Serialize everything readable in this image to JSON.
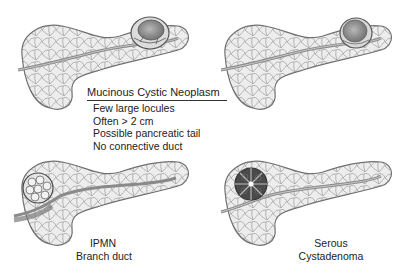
{
  "figure": {
    "panels": [
      {
        "id": "mcn",
        "lesion": "Mucinous Cystic Neoplasm",
        "location": "tail",
        "cyst_style": "unilocular-large"
      },
      {
        "id": "tail-cyst",
        "lesion": "",
        "location": "tail",
        "cyst_style": "unilocular-large"
      },
      {
        "id": "ipmn",
        "lesion": "IPMN Branch duct",
        "location": "head",
        "cyst_style": "grape-cluster"
      },
      {
        "id": "serous",
        "lesion": "Serous Cystadenoma",
        "location": "head",
        "cyst_style": "microcystic-central-scar"
      }
    ],
    "mcn_callout": {
      "title": "Mucinous Cystic Neoplasm",
      "features": [
        "Few large locules",
        "Often > 2 cm",
        "Possible pancreatic tail",
        "No connective duct"
      ]
    },
    "ipmn_label": {
      "line1": "IPMN",
      "line2": "Branch duct"
    },
    "serous_label": {
      "line1": "Serous",
      "line2": "Cystadenoma"
    },
    "colors": {
      "parenchyma_fill": "#ececec",
      "lobule_stroke": "#9a9a9a",
      "outline": "#6e6e6e",
      "duct": "#8a8a8a",
      "cyst_dark": "#4a4a4a"
    }
  }
}
